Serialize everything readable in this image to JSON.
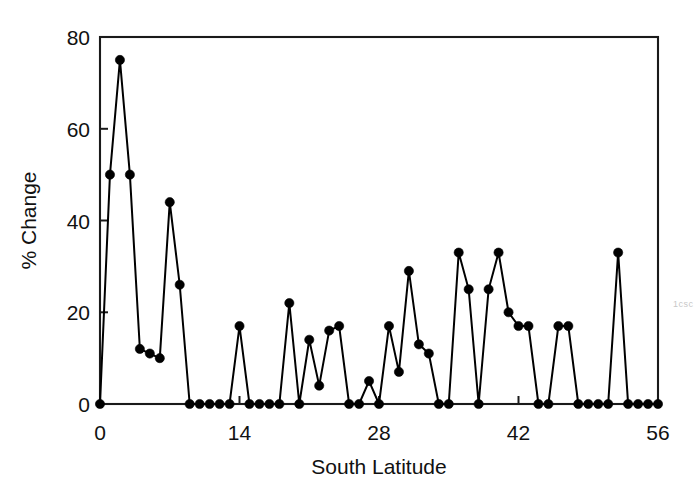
{
  "chart_data": {
    "type": "line",
    "title": "",
    "xlabel": "South Latitude",
    "ylabel": "% Change",
    "xlim": [
      0,
      56
    ],
    "ylim": [
      0,
      80
    ],
    "xticks": [
      0,
      14,
      28,
      42,
      56
    ],
    "yticks": [
      0,
      20,
      40,
      60,
      80
    ],
    "xtick_labels": [
      "0",
      "14",
      "28",
      "42",
      "56"
    ],
    "ytick_labels": [
      "0",
      "20",
      "40",
      "60",
      "80"
    ],
    "grid": false,
    "legend": null,
    "marker": "filled-circle",
    "line_color": "#000000",
    "marker_color": "#000000",
    "frame_color": "#1a1a1a",
    "background": "#ffffff",
    "x": [
      0,
      1,
      2,
      3,
      4,
      5,
      6,
      7,
      8,
      9,
      10,
      11,
      12,
      13,
      14,
      15,
      16,
      17,
      18,
      19,
      20,
      21,
      22,
      23,
      24,
      25,
      26,
      27,
      28,
      29,
      30,
      31,
      32,
      33,
      34,
      35,
      36,
      37,
      38,
      39,
      40,
      41,
      42,
      43,
      44,
      45,
      46,
      47,
      48,
      49,
      50,
      51,
      52,
      53,
      54,
      55,
      56
    ],
    "values": [
      0,
      50,
      75,
      50,
      12,
      11,
      10,
      44,
      26,
      0,
      0,
      0,
      0,
      0,
      17,
      0,
      0,
      0,
      0,
      22,
      0,
      14,
      4,
      16,
      17,
      0,
      0,
      5,
      0,
      17,
      7,
      29,
      13,
      11,
      0,
      0,
      33,
      25,
      0,
      25,
      33,
      20,
      17,
      17,
      0,
      0,
      17,
      17,
      0,
      0,
      0,
      0,
      33,
      0,
      0,
      0,
      0
    ],
    "series": [
      {
        "name": "% Change",
        "values": [
          0,
          50,
          75,
          50,
          12,
          11,
          10,
          44,
          26,
          0,
          0,
          0,
          0,
          0,
          17,
          0,
          0,
          0,
          0,
          22,
          0,
          14,
          4,
          16,
          17,
          0,
          0,
          5,
          0,
          17,
          7,
          29,
          13,
          11,
          0,
          0,
          33,
          25,
          0,
          25,
          33,
          20,
          17,
          17,
          0,
          0,
          17,
          17,
          0,
          0,
          0,
          0,
          33,
          0,
          0,
          0,
          0
        ]
      }
    ]
  },
  "edge_artifact": {
    "text": "1 c s c"
  }
}
